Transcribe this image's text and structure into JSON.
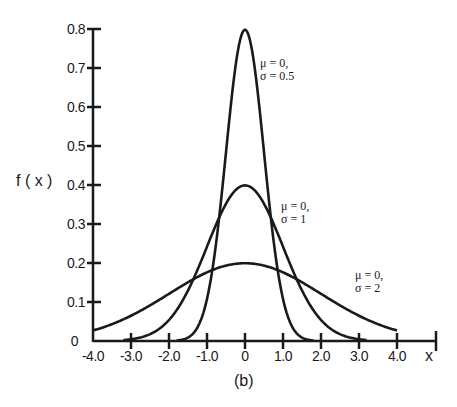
{
  "chart_data": {
    "type": "line",
    "title": "",
    "caption": "(b)",
    "xlabel": "x",
    "ylabel": "f ( x )",
    "xlim": [
      -4.0,
      4.0
    ],
    "ylim": [
      0,
      0.8
    ],
    "grid": false,
    "legend": "none (inline annotations)",
    "x_ticks": [
      "-4.0",
      "-3.0",
      "-2.0",
      "-1.0",
      "0",
      "1.0",
      "2.0",
      "3.0",
      "4.0"
    ],
    "y_ticks": [
      "0",
      "0.1",
      "0.2",
      "0.3",
      "0.4",
      "0.5",
      "0.6",
      "0.7",
      "0.8"
    ],
    "series": [
      {
        "name": "μ = 0, σ = 0.5",
        "mu": 0,
        "sigma": 0.5,
        "peak": 0.798,
        "annotation": {
          "line1": "μ  = 0,",
          "line2": "σ  = 0.5"
        }
      },
      {
        "name": "μ = 0, σ = 1",
        "mu": 0,
        "sigma": 1,
        "peak": 0.399,
        "annotation": {
          "line1": "μ  = 0,",
          "line2": "σ  = 1"
        }
      },
      {
        "name": "μ = 0, σ = 2",
        "mu": 0,
        "sigma": 2,
        "peak": 0.199,
        "annotation": {
          "line1": "μ  = 0,",
          "line2": "σ  = 2"
        }
      }
    ],
    "x": [
      -4,
      -3,
      -2,
      -1,
      0,
      1,
      2,
      3,
      4
    ],
    "values_by_series": {
      "sigma_0.5": [
        0.0,
        0.0,
        0.0003,
        0.108,
        0.798,
        0.108,
        0.0003,
        0.0,
        0.0
      ],
      "sigma_1": [
        0.0001,
        0.0044,
        0.054,
        0.242,
        0.399,
        0.242,
        0.054,
        0.0044,
        0.0001
      ],
      "sigma_2": [
        0.027,
        0.065,
        0.121,
        0.176,
        0.199,
        0.176,
        0.121,
        0.065,
        0.027
      ]
    }
  },
  "axis": {
    "origin_label": "0",
    "x_end_label": "x"
  }
}
